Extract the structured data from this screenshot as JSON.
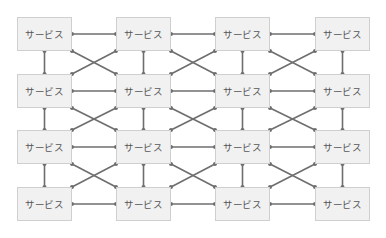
{
  "diagram": {
    "node_label": "サービス",
    "rows": 4,
    "cols": 4,
    "col_x": [
      17,
      116,
      215,
      315
    ],
    "row_y": [
      17,
      74,
      130,
      187
    ],
    "node_width": 55,
    "node_height": 34,
    "colors": {
      "node_fill": "#f1f1f1",
      "node_border": "#cfcfcf",
      "line": "#6e6e6e",
      "dot": "#6e6e6e",
      "text": "#555555"
    },
    "nodes": [
      {
        "label": "サービス"
      },
      {
        "label": "サービス"
      },
      {
        "label": "サービス"
      },
      {
        "label": "サービス"
      },
      {
        "label": "サービス"
      },
      {
        "label": "サービス"
      },
      {
        "label": "サービス"
      },
      {
        "label": "サービス"
      },
      {
        "label": "サービス"
      },
      {
        "label": "サービス"
      },
      {
        "label": "サービス"
      },
      {
        "label": "サービス"
      },
      {
        "label": "サービス"
      },
      {
        "label": "サービス"
      },
      {
        "label": "サービス"
      },
      {
        "label": "サービス"
      }
    ],
    "connections": {
      "horizontal": "every adjacent pair in a row",
      "vertical": "every adjacent pair in a column",
      "cross": "X between diagonal neighbours in every gap"
    }
  }
}
